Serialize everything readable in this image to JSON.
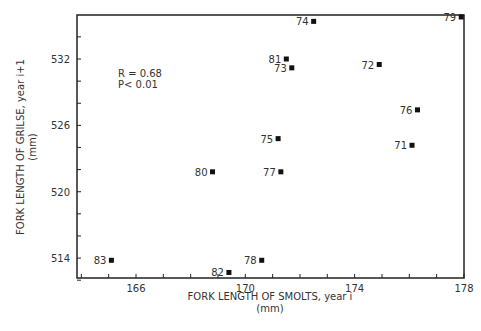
{
  "chart_data": {
    "type": "scatter",
    "title": "",
    "xlabel": "FORK LENGTH OF SMOLTS, year i",
    "xlabel_unit": "(mm)",
    "ylabel": "FORK LENGTH OF GRILSE, year i+1",
    "ylabel_unit": "(mm)",
    "xlim": [
      163,
      178
    ],
    "ylim": [
      512,
      536
    ],
    "x_ticks": [
      166,
      170,
      174,
      178
    ],
    "y_ticks": [
      514,
      520,
      526,
      532
    ],
    "grid": false,
    "annotation": [
      "R = 0.68",
      "P< 0.01"
    ],
    "points": [
      {
        "label": "71",
        "x": 176.1,
        "y": 524.2
      },
      {
        "label": "72",
        "x": 174.9,
        "y": 531.5
      },
      {
        "label": "73",
        "x": 171.7,
        "y": 531.2
      },
      {
        "label": "74",
        "x": 172.5,
        "y": 535.4
      },
      {
        "label": "75",
        "x": 171.2,
        "y": 524.8
      },
      {
        "label": "76",
        "x": 176.3,
        "y": 527.4
      },
      {
        "label": "77",
        "x": 171.3,
        "y": 521.8
      },
      {
        "label": "78",
        "x": 170.6,
        "y": 513.8
      },
      {
        "label": "79",
        "x": 177.9,
        "y": 535.8
      },
      {
        "label": "80",
        "x": 168.8,
        "y": 521.8
      },
      {
        "label": "81",
        "x": 171.5,
        "y": 532.0
      },
      {
        "label": "82",
        "x": 169.4,
        "y": 512.7
      },
      {
        "label": "83",
        "x": 165.1,
        "y": 513.8
      }
    ]
  }
}
